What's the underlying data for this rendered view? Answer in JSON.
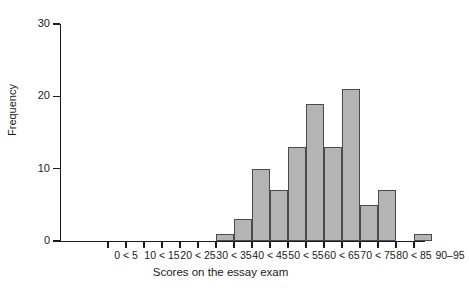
{
  "chart_data": {
    "type": "bar",
    "title": "",
    "subtitle": "",
    "xlabel": "Scores on the essay exam",
    "ylabel": "Frequency",
    "ylim": [
      0,
      30
    ],
    "yticks": [
      0,
      10,
      20,
      30
    ],
    "grid": false,
    "legend": null,
    "bar_color": "#b4b4b4",
    "bar_edge_color": "#4a4a4a",
    "axis_color": "#1a1a1a",
    "categories": [
      "0 < 5",
      "5 < 10",
      "10 < 15",
      "15 < 20",
      "20 < 25",
      "25 < 30",
      "30 < 35",
      "35 < 40",
      "40 < 45",
      "45 < 50",
      "50 < 55",
      "55 < 60",
      "60 < 65",
      "65 < 70",
      "70 < 75",
      "75 < 80",
      "80 < 85",
      "85 < 90",
      "90–95"
    ],
    "values": [
      0,
      0,
      0,
      0,
      0,
      0,
      1,
      3,
      10,
      7,
      13,
      19,
      13,
      21,
      5,
      7,
      0,
      1,
      0
    ],
    "visible_tick_labels": [
      "0 < 5",
      "10 < 15",
      "20 < 25",
      "30 < 35",
      "40 < 45",
      "50 < 55",
      "60 < 65",
      "70 < 75",
      "80 < 85",
      "90–95"
    ],
    "visible_tick_label_indices": [
      0,
      2,
      4,
      6,
      8,
      10,
      12,
      14,
      16,
      18
    ]
  },
  "axes": {
    "y_title": "Frequency",
    "x_title": "Scores on the essay exam",
    "y_tick_labels": [
      "0",
      "10",
      "20",
      "30"
    ]
  }
}
